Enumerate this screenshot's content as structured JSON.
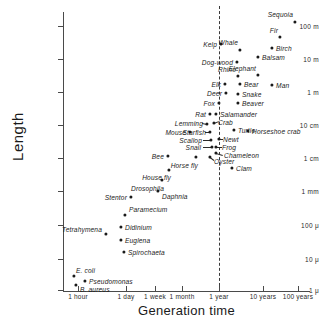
{
  "chart_data": {
    "type": "scatter",
    "title": "",
    "xlabel": "Generation time",
    "ylabel": "Length",
    "xscale": "log",
    "yscale": "log",
    "grid": false,
    "legend": null,
    "annotations": [
      {
        "name": "one-year-line",
        "kind": "vertical-dashed-line",
        "x_label": "1 year"
      }
    ],
    "xticks": [
      {
        "label": "1 hour",
        "px": 78
      },
      {
        "label": "1 day",
        "px": 126
      },
      {
        "label": "1 week",
        "px": 155
      },
      {
        "label": "1 month",
        "px": 182
      },
      {
        "label": "1 year",
        "px": 219
      },
      {
        "label": "10 years",
        "px": 263
      },
      {
        "label": "100 years",
        "px": 298
      }
    ],
    "yticks": [
      {
        "label": "100 m",
        "px": 26
      },
      {
        "label": "10 m",
        "px": 59
      },
      {
        "label": "1 m",
        "px": 92
      },
      {
        "label": "10 cm",
        "px": 125
      },
      {
        "label": "1 cm",
        "px": 158
      },
      {
        "label": "1 mm",
        "px": 191
      },
      {
        "label": "100 μ",
        "px": 225
      },
      {
        "label": "10 μ",
        "px": 259
      },
      {
        "label": "1 μ",
        "px": 290
      }
    ],
    "points": [
      {
        "name": "Sequoia",
        "px": 295,
        "py": 22,
        "lx": 293,
        "ly": 14,
        "anchor": "right"
      },
      {
        "name": "Fir",
        "px": 280,
        "py": 37,
        "lx": 278,
        "ly": 30,
        "anchor": "right"
      },
      {
        "name": "Birch",
        "px": 272,
        "py": 48,
        "lx": 276,
        "ly": 48,
        "anchor": "left"
      },
      {
        "name": "Balsam",
        "px": 258,
        "py": 57,
        "lx": 262,
        "ly": 57,
        "anchor": "left"
      },
      {
        "name": "Whale",
        "px": 240,
        "py": 50,
        "lx": 238,
        "ly": 42,
        "anchor": "right"
      },
      {
        "name": "Kelp",
        "px": 221,
        "py": 44,
        "lx": 217,
        "ly": 44,
        "anchor": "right"
      },
      {
        "name": "Dog-wood",
        "px": 237,
        "py": 62,
        "lx": 233,
        "ly": 62,
        "anchor": "right"
      },
      {
        "name": "Elephant",
        "px": 258,
        "py": 75,
        "lx": 256,
        "ly": 68,
        "anchor": "right"
      },
      {
        "name": "Rhino",
        "px": 238,
        "py": 76,
        "lx": 236,
        "ly": 69,
        "anchor": "right"
      },
      {
        "name": "Man",
        "px": 272,
        "py": 85,
        "lx": 276,
        "ly": 85,
        "anchor": "left"
      },
      {
        "name": "Bear",
        "px": 240,
        "py": 84,
        "lx": 244,
        "ly": 84,
        "anchor": "left"
      },
      {
        "name": "Elk",
        "px": 225,
        "py": 84,
        "lx": 221,
        "ly": 84,
        "anchor": "right"
      },
      {
        "name": "Snake",
        "px": 238,
        "py": 94,
        "lx": 242,
        "ly": 94,
        "anchor": "left"
      },
      {
        "name": "Deer",
        "px": 226,
        "py": 93,
        "lx": 222,
        "ly": 93,
        "anchor": "right"
      },
      {
        "name": "Beaver",
        "px": 238,
        "py": 103,
        "lx": 242,
        "ly": 103,
        "anchor": "left"
      },
      {
        "name": "Fox",
        "px": 219,
        "py": 103,
        "lx": 215,
        "ly": 103,
        "anchor": "right"
      },
      {
        "name": "Salamander",
        "px": 216,
        "py": 114,
        "lx": 220,
        "ly": 114,
        "anchor": "left"
      },
      {
        "name": "Rat",
        "px": 210,
        "py": 114,
        "lx": 206,
        "ly": 114,
        "anchor": "right"
      },
      {
        "name": "Crab",
        "px": 214,
        "py": 123,
        "lx": 218,
        "ly": 122,
        "anchor": "left"
      },
      {
        "name": "Horseshoe crab",
        "px": 248,
        "py": 131,
        "lx": 252,
        "ly": 131,
        "anchor": "left"
      },
      {
        "name": "Lemming",
        "px": 207,
        "py": 124,
        "lx": 203,
        "ly": 123,
        "anchor": "right"
      },
      {
        "name": "Turtle",
        "px": 234,
        "py": 130,
        "lx": 238,
        "ly": 130,
        "anchor": "left"
      },
      {
        "name": "Starfish",
        "px": 210,
        "py": 132,
        "lx": 206,
        "ly": 132,
        "anchor": "right"
      },
      {
        "name": "Mouse",
        "px": 190,
        "py": 132,
        "lx": 186,
        "ly": 132,
        "anchor": "right"
      },
      {
        "name": "Newt",
        "px": 219,
        "py": 139,
        "lx": 223,
        "ly": 139,
        "anchor": "left"
      },
      {
        "name": "Scallop",
        "px": 211,
        "py": 140,
        "lx": 202,
        "ly": 140,
        "anchor": "right"
      },
      {
        "name": "Frog",
        "px": 216,
        "py": 147,
        "lx": 222,
        "ly": 147,
        "anchor": "left"
      },
      {
        "name": "Chameleon",
        "px": 216,
        "py": 153,
        "lx": 224,
        "ly": 155,
        "anchor": "left"
      },
      {
        "name": "Snail",
        "px": 212,
        "py": 147,
        "lx": 201,
        "ly": 147,
        "anchor": "right"
      },
      {
        "name": "Oyster",
        "px": 210,
        "py": 157,
        "lx": 214,
        "ly": 161,
        "anchor": "left"
      },
      {
        "name": "Clam",
        "px": 232,
        "py": 168,
        "lx": 236,
        "ly": 168,
        "anchor": "left"
      },
      {
        "name": "Horse fly",
        "px": 196,
        "py": 157,
        "lx": 198,
        "ly": 165,
        "anchor": "right"
      },
      {
        "name": "Bee",
        "px": 168,
        "py": 156,
        "lx": 164,
        "ly": 156,
        "anchor": "right"
      },
      {
        "name": "House fly",
        "px": 169,
        "py": 170,
        "lx": 171,
        "ly": 177,
        "anchor": "right"
      },
      {
        "name": "Drosophila",
        "px": 162,
        "py": 180,
        "lx": 164,
        "ly": 188,
        "anchor": "right"
      },
      {
        "name": "Daphnia",
        "px": 158,
        "py": 191,
        "lx": 162,
        "ly": 196,
        "anchor": "left"
      },
      {
        "name": "Stentor",
        "px": 131,
        "py": 197,
        "lx": 127,
        "ly": 197,
        "anchor": "right"
      },
      {
        "name": "Paramecium",
        "px": 125,
        "py": 215,
        "lx": 129,
        "ly": 209,
        "anchor": "left"
      },
      {
        "name": "Didinium",
        "px": 121,
        "py": 227,
        "lx": 125,
        "ly": 227,
        "anchor": "left"
      },
      {
        "name": "Tetrahymena",
        "px": 106,
        "py": 234,
        "lx": 102,
        "ly": 229,
        "anchor": "right"
      },
      {
        "name": "Euglena",
        "px": 121,
        "py": 240,
        "lx": 125,
        "ly": 240,
        "anchor": "left"
      },
      {
        "name": "Spirochaeta",
        "px": 124,
        "py": 252,
        "lx": 128,
        "ly": 252,
        "anchor": "left"
      },
      {
        "name": "E. coli",
        "px": 74,
        "py": 276,
        "lx": 76,
        "ly": 270,
        "anchor": "left"
      },
      {
        "name": "Pseudomonas",
        "px": 85,
        "py": 281,
        "lx": 89,
        "ly": 281,
        "anchor": "left"
      },
      {
        "name": "B. aureus",
        "px": 76,
        "py": 285,
        "lx": 80,
        "ly": 289,
        "anchor": "left"
      }
    ],
    "leaders": [
      {
        "from_name": "Crab",
        "x1": 214,
        "y1": 123,
        "x2": 219,
        "y2": 121
      },
      {
        "from_name": "Lemming",
        "x1": 207,
        "y1": 124,
        "x2": 202,
        "y2": 123
      },
      {
        "from_name": "Starfish",
        "x1": 210,
        "y1": 132,
        "x2": 205,
        "y2": 132
      },
      {
        "from_name": "Scallop",
        "x1": 211,
        "y1": 140,
        "x2": 203,
        "y2": 140
      },
      {
        "from_name": "Snail",
        "x1": 212,
        "y1": 147,
        "x2": 203,
        "y2": 147
      },
      {
        "from_name": "Newt",
        "x1": 219,
        "y1": 139,
        "x2": 223,
        "y2": 139
      },
      {
        "from_name": "Frog",
        "x1": 216,
        "y1": 147,
        "x2": 222,
        "y2": 147
      },
      {
        "from_name": "Chameleon",
        "x1": 216,
        "y1": 153,
        "x2": 223,
        "y2": 155
      },
      {
        "from_name": "Oyster",
        "x1": 210,
        "y1": 157,
        "x2": 214,
        "y2": 160
      }
    ]
  }
}
